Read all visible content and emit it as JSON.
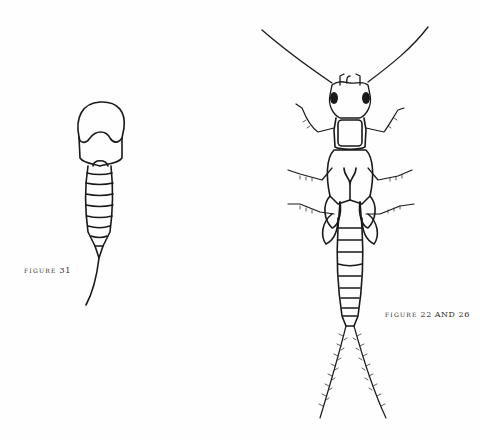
{
  "page": {
    "background": "#fefefe",
    "ink_color": "#1a1a1a"
  },
  "figures": [
    {
      "id": "figure-31",
      "caption_word": "FIGURE",
      "caption_number": "31",
      "subject": "nymph-outline-dorsal"
    },
    {
      "id": "figure-22-and-26",
      "caption_word": "FIGURE",
      "caption_number": "22 AND 26",
      "subject": "stonefly-nymph-dorsal"
    }
  ]
}
